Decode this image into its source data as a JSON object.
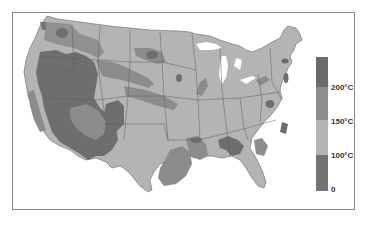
{
  "map": {
    "subject": "United States temperature zones",
    "colors": {
      "zone_200_plus": "#6e6e6e",
      "zone_150_200": "#8c8c8c",
      "zone_100_150": "#b4b4b4",
      "zone_0_100": "#777777",
      "state_border": "#555555",
      "water": "#ffffff",
      "frame": "#8a8a8a"
    }
  },
  "legend": {
    "orientation": "vertical",
    "segments": [
      {
        "range": ">200°C",
        "color": "#6a6a6a"
      },
      {
        "range": "150–200°C",
        "color": "#8e8e8e"
      },
      {
        "range": "100–150°C",
        "color": "#b3b3b3"
      },
      {
        "range": "0–100°C",
        "color": "#727272"
      }
    ],
    "labels": [
      "200°C",
      "150°C",
      "100°C",
      "0"
    ]
  }
}
